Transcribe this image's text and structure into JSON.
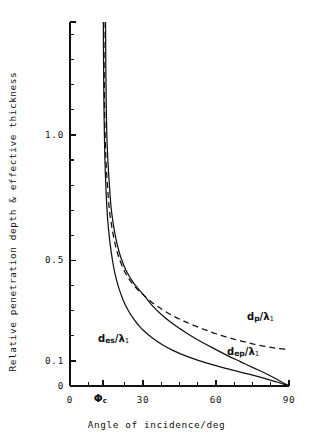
{
  "chart_data": {
    "type": "line",
    "title": "",
    "xlabel": "Angle of incidence/deg",
    "ylabel": "Relative penetration depth & effective thickness",
    "xlim": [
      0,
      90
    ],
    "ylim": [
      0,
      1.45
    ],
    "grid": false,
    "legend_position": "inline-annotations",
    "xticks_major": [
      {
        "value": 0,
        "label": "0"
      },
      {
        "value": 13.5,
        "label": "Φc"
      },
      {
        "value": 30,
        "label": "30"
      },
      {
        "value": 60,
        "label": "60"
      },
      {
        "value": 90,
        "label": "90"
      }
    ],
    "xticks_minor": [
      7.5,
      22.5,
      37.5,
      45,
      52.5,
      67.5,
      75,
      82.5
    ],
    "yticks_major": [
      {
        "value": 0,
        "label": "0"
      },
      {
        "value": 0.1,
        "label": "0.1"
      },
      {
        "value": 0.5,
        "label": "0.5"
      },
      {
        "value": 1.0,
        "label": "1.0"
      }
    ],
    "yticks_minor": [
      0.2,
      0.3,
      0.4,
      0.6,
      0.7,
      0.8,
      0.9,
      1.1,
      1.2,
      1.3,
      1.4
    ],
    "critical_angle_deg": 13.5,
    "series": [
      {
        "name": "d_p/lambda_1",
        "label_text": "d_p/λ₁",
        "style": "dashed",
        "color": "#111111",
        "points": [
          [
            13.9,
            1.45
          ],
          [
            14.0,
            1.3
          ],
          [
            14.2,
            1.12
          ],
          [
            14.5,
            0.98
          ],
          [
            15.0,
            0.86
          ],
          [
            16.0,
            0.72
          ],
          [
            17.0,
            0.645
          ],
          [
            18.0,
            0.59
          ],
          [
            19.0,
            0.548
          ],
          [
            20.0,
            0.515
          ],
          [
            22.0,
            0.465
          ],
          [
            24.0,
            0.43
          ],
          [
            26.0,
            0.403
          ],
          [
            28.0,
            0.382
          ],
          [
            30.0,
            0.364
          ],
          [
            34.0,
            0.331
          ],
          [
            38.0,
            0.304
          ],
          [
            42.0,
            0.281
          ],
          [
            46.0,
            0.262
          ],
          [
            50.0,
            0.245
          ],
          [
            55.0,
            0.226
          ],
          [
            60.0,
            0.208
          ],
          [
            65.0,
            0.193
          ],
          [
            70.0,
            0.18
          ],
          [
            75.0,
            0.168
          ],
          [
            80.0,
            0.158
          ],
          [
            85.0,
            0.15
          ],
          [
            90.0,
            0.146
          ]
        ]
      },
      {
        "name": "d_ep/lambda_1",
        "label_text": "d_ep/λ₁",
        "style": "solid",
        "color": "#111111",
        "points": [
          [
            14.6,
            1.45
          ],
          [
            14.7,
            1.3
          ],
          [
            14.9,
            1.12
          ],
          [
            15.2,
            0.98
          ],
          [
            15.8,
            0.86
          ],
          [
            16.8,
            0.72
          ],
          [
            17.8,
            0.645
          ],
          [
            18.8,
            0.59
          ],
          [
            19.8,
            0.548
          ],
          [
            20.8,
            0.515
          ],
          [
            22.8,
            0.465
          ],
          [
            24.8,
            0.43
          ],
          [
            26.8,
            0.402
          ],
          [
            28.8,
            0.379
          ],
          [
            30.5,
            0.36
          ],
          [
            34.0,
            0.318
          ],
          [
            38.0,
            0.281
          ],
          [
            42.0,
            0.25
          ],
          [
            46.0,
            0.223
          ],
          [
            50.0,
            0.198
          ],
          [
            55.0,
            0.17
          ],
          [
            60.0,
            0.145
          ],
          [
            65.0,
            0.12
          ],
          [
            70.0,
            0.097
          ],
          [
            75.0,
            0.074
          ],
          [
            80.0,
            0.052
          ],
          [
            85.0,
            0.027
          ],
          [
            90.0,
            0.0
          ]
        ]
      },
      {
        "name": "d_es/lambda_1",
        "label_text": "d_es/λ₁",
        "style": "solid",
        "color": "#111111",
        "points": [
          [
            13.7,
            1.45
          ],
          [
            13.8,
            1.28
          ],
          [
            14.0,
            1.08
          ],
          [
            14.3,
            0.92
          ],
          [
            14.8,
            0.78
          ],
          [
            15.5,
            0.66
          ],
          [
            16.5,
            0.565
          ],
          [
            17.5,
            0.498
          ],
          [
            18.5,
            0.447
          ],
          [
            20.0,
            0.392
          ],
          [
            22.0,
            0.339
          ],
          [
            24.0,
            0.3
          ],
          [
            26.0,
            0.269
          ],
          [
            28.0,
            0.244
          ],
          [
            30.0,
            0.223
          ],
          [
            34.0,
            0.19
          ],
          [
            38.0,
            0.164
          ],
          [
            42.0,
            0.143
          ],
          [
            46.0,
            0.126
          ],
          [
            50.0,
            0.111
          ],
          [
            55.0,
            0.095
          ],
          [
            60.0,
            0.081
          ],
          [
            65.0,
            0.068
          ],
          [
            70.0,
            0.055
          ],
          [
            75.0,
            0.043
          ],
          [
            80.0,
            0.03
          ],
          [
            85.0,
            0.016
          ],
          [
            90.0,
            0.0
          ]
        ]
      }
    ],
    "annotations": [
      {
        "id": "dp",
        "text": "d_p/λ₁",
        "x_px": 247,
        "y_px": 311
      },
      {
        "id": "des",
        "text": "d_es/λ₁",
        "x_px": 98,
        "y_px": 333
      },
      {
        "id": "dep",
        "text": "d_ep/λ₁",
        "x_px": 227,
        "y_px": 346
      }
    ],
    "label_parts": {
      "dp": {
        "base": "d",
        "sub": "p",
        "slash": "/",
        "lam": "λ",
        "lamsub": "1"
      },
      "des": {
        "base": "d",
        "sub": "es",
        "slash": "/",
        "lam": "λ",
        "lamsub": "1"
      },
      "dep": {
        "base": "d",
        "sub": "ep",
        "slash": "/",
        "lam": "λ",
        "lamsub": "1"
      },
      "phi": {
        "base": "Φ",
        "sub": "c"
      }
    },
    "colors": {
      "axis": "#111111",
      "curve": "#111111",
      "background": "#ffffff"
    }
  }
}
